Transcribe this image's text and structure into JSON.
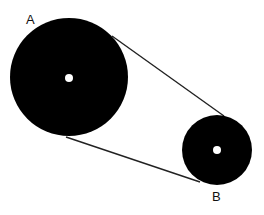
{
  "diagram": {
    "type": "belt-pulley",
    "pulleys": [
      {
        "label": "A",
        "cx": 69,
        "cy": 77,
        "r": 59,
        "hub_r": 4
      },
      {
        "label": "B",
        "cx": 217,
        "cy": 150,
        "r": 35,
        "hub_r": 4
      }
    ],
    "belt": [
      {
        "x1": 112,
        "y1": 36,
        "x2": 224,
        "y2": 116
      },
      {
        "x1": 66,
        "y1": 137,
        "x2": 200,
        "y2": 182
      }
    ],
    "colors": {
      "fill": "#000000",
      "hub": "#ffffff",
      "belt": "#222222"
    }
  },
  "labels": {
    "a": "A",
    "b": "B"
  }
}
